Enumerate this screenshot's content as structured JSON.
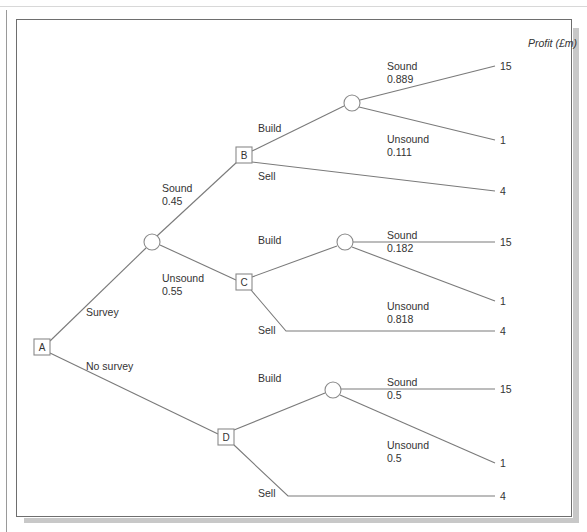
{
  "diagram": {
    "type": "decision-tree",
    "header": "Profit (£m)",
    "nodes": {
      "A": "A",
      "B": "B",
      "C": "C",
      "D": "D"
    },
    "branches": {
      "survey": "Survey",
      "no_survey": "No survey",
      "sound_045": {
        "label": "Sound",
        "prob": "0.45"
      },
      "unsound_055": {
        "label": "Unsound",
        "prob": "0.55"
      },
      "b_build": "Build",
      "b_sell": "Sell",
      "c_build": "Build",
      "c_sell": "Sell",
      "d_build": "Build",
      "d_sell": "Sell",
      "b_sound": {
        "label": "Sound",
        "prob": "0.889"
      },
      "b_unsound": {
        "label": "Unsound",
        "prob": "0.111"
      },
      "c_sound": {
        "label": "Sound",
        "prob": "0.182"
      },
      "c_unsound": {
        "label": "Unsound",
        "prob": "0.818"
      },
      "d_sound": {
        "label": "Sound",
        "prob": "0.5"
      },
      "d_unsound": {
        "label": "Unsound",
        "prob": "0.5"
      }
    },
    "payoffs": [
      "15",
      "1",
      "4",
      "15",
      "1",
      "4",
      "15",
      "1",
      "4"
    ]
  }
}
